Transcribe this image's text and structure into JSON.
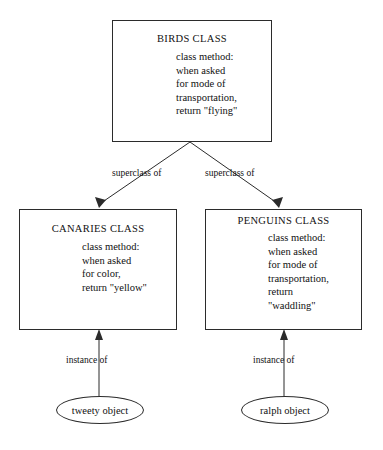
{
  "diagram": {
    "background_color": "#ffffff",
    "line_color": "#2b2b2b",
    "text_color": "#111111"
  },
  "classes": {
    "birds": {
      "title": "BIRDS CLASS",
      "body_lines": [
        "class method:",
        "when asked",
        "for mode of",
        "transportation,",
        "return \"flying\""
      ]
    },
    "canaries": {
      "title": "CANARIES CLASS",
      "body_lines": [
        "class method:",
        "when asked",
        "for color,",
        "return \"yellow\""
      ]
    },
    "penguins": {
      "title": "PENGUINS CLASS",
      "body_lines": [
        "class method:",
        "when asked",
        "for mode of",
        "transportation,",
        "return",
        "\"waddling\""
      ]
    }
  },
  "objects": {
    "tweety": {
      "label": "tweety object"
    },
    "ralph": {
      "label": "ralph object"
    }
  },
  "edges": {
    "superclass_left": {
      "label": "superclass of"
    },
    "superclass_right": {
      "label": "superclass of"
    },
    "instance_left": {
      "label": "instance of"
    },
    "instance_right": {
      "label": "instance of"
    }
  }
}
